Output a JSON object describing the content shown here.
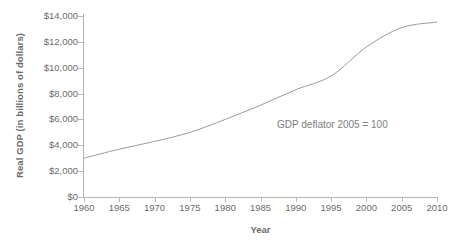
{
  "chart_data": {
    "type": "line",
    "title": "",
    "subtitle": "",
    "xlabel": "Year",
    "ylabel": "Real GDP (in billions of dollars)",
    "xlim": [
      1960,
      2010
    ],
    "ylim": [
      0,
      14000
    ],
    "grid": false,
    "legend": false,
    "legend_position": "none",
    "annotations": [
      {
        "text": "GDP deflator 2005 = 100",
        "x": 1995,
        "y": 5300
      }
    ],
    "x_tick_labels": [
      "1960",
      "1965",
      "1970",
      "1975",
      "1980",
      "1985",
      "1990",
      "1995",
      "2000",
      "2005",
      "2010"
    ],
    "x_ticks": [
      1960,
      1965,
      1970,
      1975,
      1980,
      1985,
      1990,
      1995,
      2000,
      2005,
      2010
    ],
    "y_tick_labels": [
      "$0",
      "$2,000",
      "$4,000",
      "$6,000",
      "$8,000",
      "$10,000",
      "$12,000",
      "$14,000"
    ],
    "y_ticks": [
      0,
      2000,
      4000,
      6000,
      8000,
      10000,
      12000,
      14000
    ],
    "series": [
      {
        "name": "Real GDP",
        "color": "#9a9a9a",
        "x": [
          1960,
          1965,
          1970,
          1975,
          1980,
          1985,
          1990,
          1995,
          2000,
          2005,
          2010
        ],
        "values": [
          3000,
          3700,
          4300,
          5000,
          6000,
          7100,
          8300,
          9360,
          11600,
          13100,
          13530
        ]
      }
    ]
  },
  "axes": {
    "y_title": "Real GDP (in billions of dollars)",
    "x_title": "Year"
  },
  "annotation": {
    "text": "GDP deflator 2005 = 100"
  },
  "colors": {
    "line": "#9a9a9a",
    "axis": "#b4b4b4",
    "text": "#6b6b6b",
    "background": "#ffffff"
  }
}
